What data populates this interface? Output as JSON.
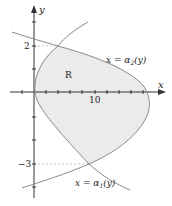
{
  "figure": {
    "axes": {
      "x_label": "x",
      "y_label": "y",
      "x_tick_label": "10",
      "y_tick_labels": [
        "2",
        "−3"
      ]
    },
    "region_label": "R",
    "curves": [
      {
        "id": "alpha2",
        "label": "x = α2(y)",
        "label_parts": {
          "lhs": "x = α",
          "sub": "2",
          "rhs": "(y)"
        }
      },
      {
        "id": "alpha1",
        "label": "x = α1(y)",
        "label_parts": {
          "lhs": "x = α",
          "sub": "1",
          "rhs": "(y)"
        }
      }
    ],
    "intersections": [
      {
        "y": 2
      },
      {
        "y": -3
      }
    ],
    "colors": {
      "region_fill": "#ebebeb",
      "curve": "#8a8a8a",
      "axis": "#333333",
      "dashed": "#aaaaaa"
    }
  }
}
